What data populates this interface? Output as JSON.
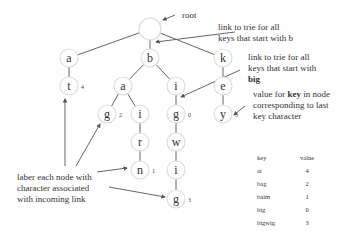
{
  "diagram": {
    "title": "trie",
    "nodes": [
      {
        "id": "root",
        "label": "",
        "x": 150,
        "y": 29,
        "value": ""
      },
      {
        "id": "a1",
        "label": "a",
        "x": 69,
        "y": 58,
        "value": ""
      },
      {
        "id": "b1",
        "label": "b",
        "x": 150,
        "y": 58,
        "value": ""
      },
      {
        "id": "k1",
        "label": "k",
        "x": 223,
        "y": 58,
        "value": ""
      },
      {
        "id": "t2",
        "label": "t",
        "x": 69,
        "y": 86,
        "value": "4"
      },
      {
        "id": "a2",
        "label": "a",
        "x": 123,
        "y": 86,
        "value": ""
      },
      {
        "id": "i2",
        "label": "i",
        "x": 176,
        "y": 86,
        "value": ""
      },
      {
        "id": "e2",
        "label": "e",
        "x": 223,
        "y": 86,
        "value": ""
      },
      {
        "id": "g3a",
        "label": "g",
        "x": 107,
        "y": 114,
        "value": "2"
      },
      {
        "id": "i3",
        "label": "i",
        "x": 140,
        "y": 114,
        "value": ""
      },
      {
        "id": "g3b",
        "label": "g",
        "x": 176,
        "y": 114,
        "value": "0"
      },
      {
        "id": "y3",
        "label": "y",
        "x": 223,
        "y": 114,
        "value": "5"
      },
      {
        "id": "r4",
        "label": "r",
        "x": 140,
        "y": 142,
        "value": ""
      },
      {
        "id": "w4",
        "label": "w",
        "x": 176,
        "y": 142,
        "value": ""
      },
      {
        "id": "n5",
        "label": "n",
        "x": 140,
        "y": 170,
        "value": "1"
      },
      {
        "id": "i5",
        "label": "i",
        "x": 176,
        "y": 170,
        "value": ""
      },
      {
        "id": "g6",
        "label": "g",
        "x": 176,
        "y": 199,
        "value": "3"
      }
    ],
    "edges": [
      [
        "root",
        "a1"
      ],
      [
        "root",
        "b1"
      ],
      [
        "root",
        "k1"
      ],
      [
        "a1",
        "t2"
      ],
      [
        "b1",
        "a2"
      ],
      [
        "b1",
        "i2"
      ],
      [
        "k1",
        "e2"
      ],
      [
        "a2",
        "g3a"
      ],
      [
        "a2",
        "i3"
      ],
      [
        "i2",
        "g3b"
      ],
      [
        "e2",
        "y3"
      ],
      [
        "i3",
        "r4"
      ],
      [
        "g3b",
        "w4"
      ],
      [
        "r4",
        "n5"
      ],
      [
        "w4",
        "i5"
      ],
      [
        "i5",
        "g6"
      ]
    ],
    "annotations": {
      "root": "root",
      "link_b_line1": "link to trie for all",
      "link_b_line2": "keys that start with b",
      "link_big_line1": "link to trie for all",
      "link_big_line2": "keys that start with",
      "link_big_line3": "big",
      "value_line1_pre": "value for ",
      "value_line1_bold": "key",
      "value_line1_post": " in node",
      "value_line2": "corresponding to last",
      "value_line3": "key character",
      "label_line1": "laber each node with",
      "label_line2": "character associated",
      "label_line3": "with incoming link"
    }
  },
  "table": {
    "headers": {
      "key": "key",
      "value": "value"
    },
    "rows": [
      {
        "key": "at",
        "value": "4"
      },
      {
        "key": "bag",
        "value": "2"
      },
      {
        "key": "baim",
        "value": "1"
      },
      {
        "key": "big",
        "value": "0"
      },
      {
        "key": "bigwig",
        "value": "3"
      },
      {
        "key": "key",
        "value": "5"
      }
    ]
  }
}
